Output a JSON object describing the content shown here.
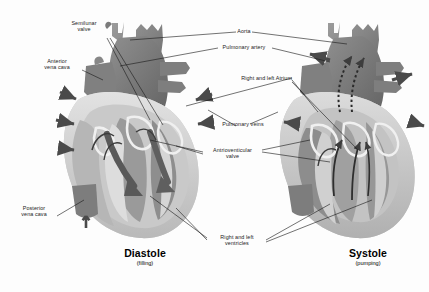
{
  "figure": {
    "background": "#fdfdfd"
  },
  "palette": {
    "ink": "#1a1a1a",
    "muscle_dark": "#6f6f6f",
    "muscle_mid": "#8c8c8c",
    "muscle_light": "#b4b4b4",
    "chamber_pale": "#d8d8d8",
    "lining": "#efefef",
    "vessel": "#7b7b7b",
    "arrow": "#4a4a4a"
  },
  "labels": [
    {
      "id": "semilunar-valve",
      "text": "Semilunar\nvalve",
      "line1": "Semilunar",
      "line2": "valve"
    },
    {
      "id": "anterior-vena-cava",
      "text": "Anterior\nvena cava",
      "line1": "Anterior",
      "line2": "vena cava"
    },
    {
      "id": "posterior-vena-cava",
      "text": "Posterior\nvena cava",
      "line1": "Posterior",
      "line2": "vena cava"
    },
    {
      "id": "aorta",
      "text": "Aorta",
      "line1": "Aorta",
      "line2": ""
    },
    {
      "id": "pulmonary-artery",
      "text": "Pulmonary artery",
      "line1": "Pulmonary artery",
      "line2": ""
    },
    {
      "id": "right-and-left-atrium",
      "text": "Right and left Atrium",
      "line1": "Right and left Atrium",
      "line2": ""
    },
    {
      "id": "pulmonary-veins",
      "text": "Pulmonary veins",
      "line1": "Pulmonary veins",
      "line2": ""
    },
    {
      "id": "atrioventricular-valve",
      "text": "Antrioventicular\nvalve",
      "line1": "Antrioventicular",
      "line2": "valve"
    },
    {
      "id": "right-and-left-ventricles",
      "text": "Right and left\nventricles",
      "line1": "Right and left",
      "line2": "ventricles"
    }
  ],
  "captions": {
    "left": {
      "title": "Diastole",
      "subtitle": "(filling)"
    },
    "right": {
      "title": "Systole",
      "subtitle": "(pumping)"
    }
  }
}
